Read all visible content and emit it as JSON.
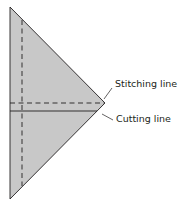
{
  "diagram": {
    "labels": {
      "stitching": "Stitching line",
      "cutting": "Cutting line"
    },
    "colors": {
      "fill": "#c8c8c8",
      "stroke": "#231f20",
      "background": "#ffffff"
    },
    "shape": {
      "type": "triangle",
      "points": [
        [
          10,
          7
        ],
        [
          105,
          103
        ],
        [
          10,
          199
        ]
      ]
    },
    "lines": {
      "stitching_horizontal_y": 103,
      "cutting_horizontal_y": 111,
      "stitching_vertical_x": 22
    }
  }
}
